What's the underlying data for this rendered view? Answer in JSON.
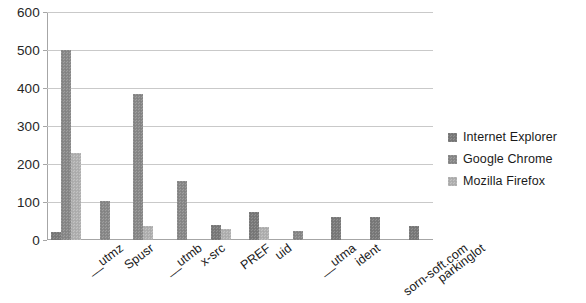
{
  "chart_data": {
    "type": "bar",
    "title": "",
    "subtitle": "",
    "xlabel": "",
    "ylabel": "",
    "ylim": [
      0,
      600
    ],
    "ytick_step": 100,
    "yticks": [
      "0",
      "100",
      "200",
      "300",
      "400",
      "500",
      "600"
    ],
    "grid": true,
    "grid_axis": "y",
    "legend_position": "right",
    "bar_orientation": "vertical",
    "grouping": "grouped",
    "categories": [
      "__utmz",
      "Spusr",
      "__utmb",
      "x-src",
      "PREF",
      "uid",
      "__utma",
      "ident",
      "sorn-soft.com",
      "parkinglot"
    ],
    "series": [
      {
        "name": "Internet Explorer",
        "color": "#7b7b7b",
        "values": [
          20,
          0,
          0,
          0,
          40,
          75,
          0,
          60,
          60,
          38
        ]
      },
      {
        "name": "Google Chrome",
        "color": "#8a8a8a",
        "values": [
          500,
          103,
          385,
          155,
          0,
          0,
          25,
          0,
          0,
          0
        ]
      },
      {
        "name": "Mozilla Firefox",
        "color": "#b2b2b2",
        "values": [
          230,
          0,
          38,
          0,
          28,
          33,
          0,
          0,
          0,
          0
        ]
      }
    ]
  },
  "legend": {
    "items": [
      {
        "label": "Internet Explorer"
      },
      {
        "label": "Google Chrome"
      },
      {
        "label": "Mozilla Firefox"
      }
    ]
  },
  "colors": {
    "series_1": "#7b7b7b",
    "series_2": "#8a8a8a",
    "series_3": "#b2b2b2",
    "gridline": "#c9c9c9",
    "axis": "#a6a6a6",
    "text": "#1a1a1a",
    "background": "#ffffff"
  }
}
